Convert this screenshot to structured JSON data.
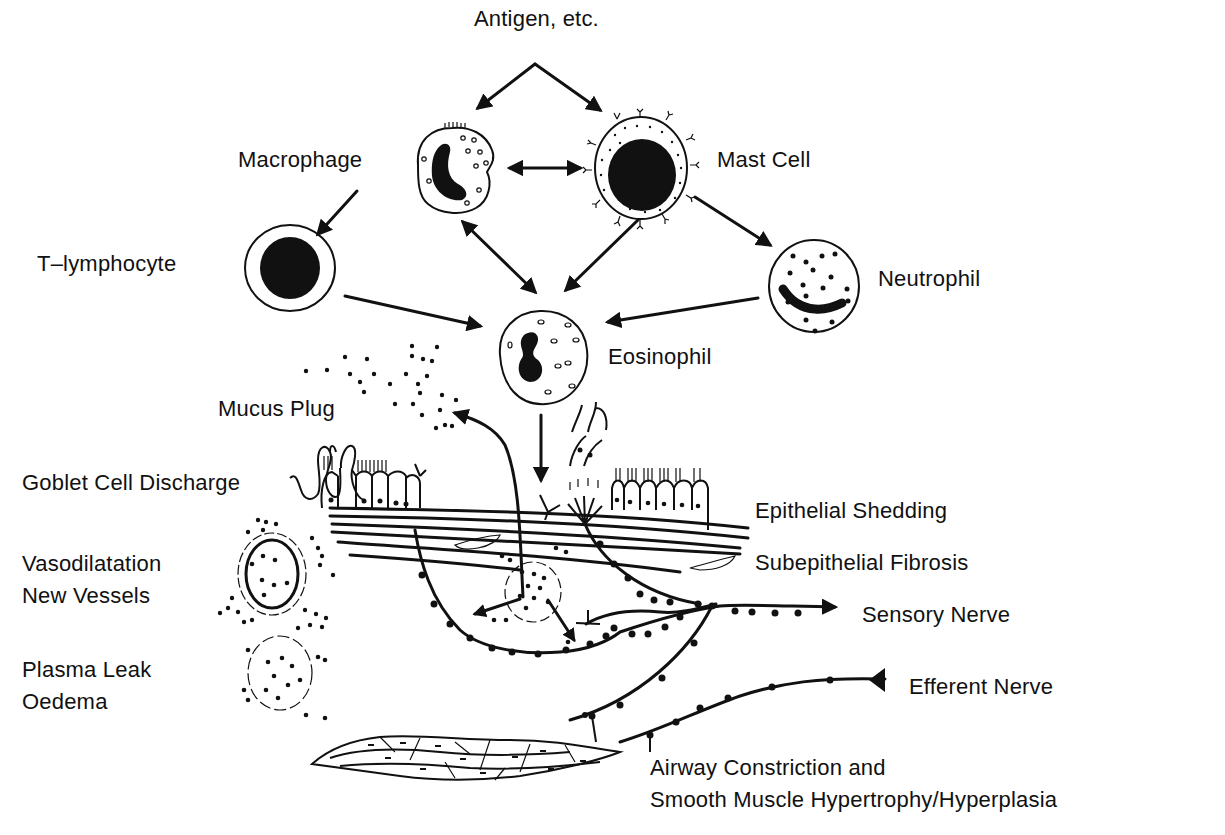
{
  "figure": {
    "colors": {
      "ink": "#111111",
      "background": "#ffffff"
    }
  },
  "labels": {
    "antigen": "Antigen, etc.",
    "macrophage": "Macrophage",
    "mast_cell": "Mast Cell",
    "t_lymphocyte": "T–lymphocyte",
    "neutrophil": "Neutrophil",
    "eosinophil": "Eosinophil",
    "mucus_plug": "Mucus Plug",
    "goblet_cell_discharge": "Goblet Cell Discharge",
    "epithelial_shedding": "Epithelial Shedding",
    "subepithelial_fibrosis": "Subepithelial Fibrosis",
    "vasodilatation": "Vasodilatation",
    "new_vessels": "New Vessels",
    "sensory_nerve": "Sensory Nerve",
    "plasma_leak": "Plasma Leak",
    "oedema": "Oedema",
    "efferent_nerve": "Efferent Nerve",
    "airway_constriction": "Airway Constriction and",
    "smooth_muscle": "Smooth Muscle Hypertrophy/Hyperplasia"
  },
  "nodes": [
    {
      "id": "antigen",
      "type": "stimulus"
    },
    {
      "id": "macrophage",
      "type": "cell"
    },
    {
      "id": "mast_cell",
      "type": "cell"
    },
    {
      "id": "t_lymphocyte",
      "type": "cell"
    },
    {
      "id": "neutrophil",
      "type": "cell"
    },
    {
      "id": "eosinophil",
      "type": "cell"
    },
    {
      "id": "airway_wall",
      "type": "tissue"
    }
  ],
  "edges": [
    {
      "from": "antigen",
      "to": "macrophage",
      "direction": "forward"
    },
    {
      "from": "antigen",
      "to": "mast_cell",
      "direction": "forward"
    },
    {
      "from": "macrophage",
      "to": "mast_cell",
      "direction": "bidirectional"
    },
    {
      "from": "macrophage",
      "to": "t_lymphocyte",
      "direction": "forward"
    },
    {
      "from": "macrophage",
      "to": "eosinophil",
      "direction": "bidirectional"
    },
    {
      "from": "mast_cell",
      "to": "eosinophil",
      "direction": "forward"
    },
    {
      "from": "mast_cell",
      "to": "neutrophil",
      "direction": "forward"
    },
    {
      "from": "t_lymphocyte",
      "to": "eosinophil",
      "direction": "forward"
    },
    {
      "from": "neutrophil",
      "to": "eosinophil",
      "direction": "forward"
    },
    {
      "from": "eosinophil",
      "to": "airway_wall",
      "direction": "forward"
    }
  ]
}
